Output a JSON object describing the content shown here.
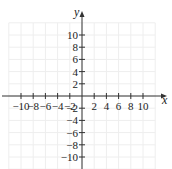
{
  "chart_data": {
    "type": "scatter",
    "title": "",
    "xlabel": "x",
    "ylabel": "y",
    "xlim": [
      -12,
      12
    ],
    "ylim": [
      -12,
      12
    ],
    "grid": true,
    "grid_step": 2,
    "x_ticks": [
      -10,
      -8,
      -6,
      -4,
      -2,
      2,
      4,
      6,
      8,
      10
    ],
    "y_ticks": [
      -10,
      -8,
      -6,
      -4,
      -2,
      2,
      4,
      6,
      8,
      10
    ],
    "x_tick_labels": [
      "−10",
      "−8",
      "−6",
      "−4",
      "−2",
      "2",
      "4",
      "6",
      "8",
      "10"
    ],
    "y_tick_labels": [
      "−10",
      "−8",
      "−6",
      "−4",
      "−2",
      "2",
      "4",
      "6",
      "8",
      "10"
    ],
    "series": [],
    "legend": null
  },
  "colors": {
    "axis": "#333333",
    "grid": "#eeeeee",
    "text": "#222222"
  }
}
